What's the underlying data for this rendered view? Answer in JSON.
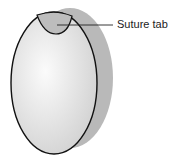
{
  "diagram": {
    "labels": [
      {
        "text": "Suture tab",
        "target": "tab"
      }
    ],
    "colors": {
      "body_fill": "#e4e4e4",
      "shadow_fill": "#b8b8b8",
      "tab_fill": "#bdbdbd",
      "outline": "#111111"
    }
  }
}
